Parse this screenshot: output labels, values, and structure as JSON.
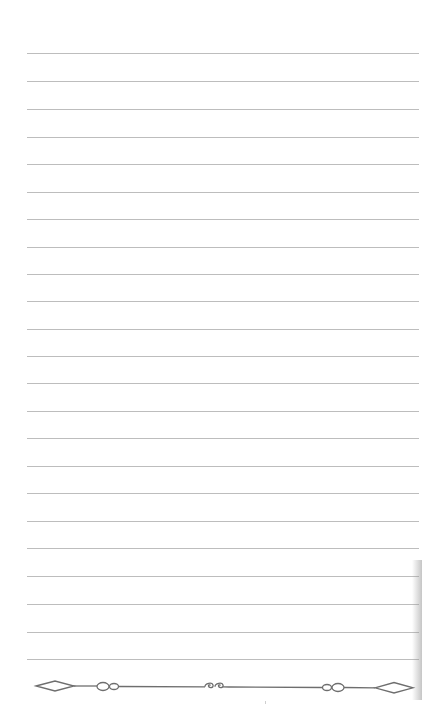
{
  "page": {
    "type": "lined-notebook-paper",
    "background_color": "#ffffff",
    "rule_color": "#bdbdbd",
    "ornament_color": "#6e6e6e",
    "rule_count": 23,
    "rule_left_px": 27,
    "rule_right_px": 419,
    "rule_y_positions": [
      53,
      81,
      109,
      137,
      164,
      192,
      219,
      247,
      274,
      301,
      329,
      356,
      383,
      411,
      438,
      466,
      493,
      521,
      548,
      576,
      604,
      632,
      659
    ]
  },
  "footer_ornament": {
    "elements": [
      {
        "type": "diamond",
        "name": "left-diamond"
      },
      {
        "type": "double-circle",
        "name": "left-loops"
      },
      {
        "type": "scroll-swirl",
        "name": "center-swirl"
      },
      {
        "type": "double-circle",
        "name": "right-loops"
      },
      {
        "type": "diamond",
        "name": "right-diamond"
      }
    ]
  },
  "icons": {
    "left_diamond": "diamond-icon",
    "left_loops": "double-loop-icon",
    "center_swirl": "scroll-swirl-icon",
    "right_loops": "double-loop-icon",
    "right_diamond": "diamond-icon"
  }
}
